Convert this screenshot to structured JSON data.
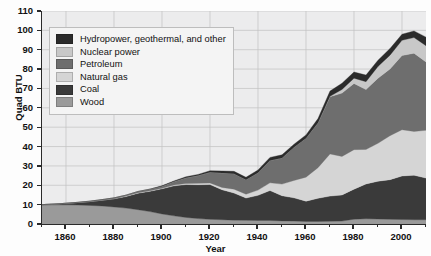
{
  "chart_data": {
    "type": "area",
    "stacked": true,
    "title": "",
    "xlabel": "Year",
    "ylabel": "Quad BTU",
    "xlim": [
      1850,
      2010
    ],
    "ylim": [
      0,
      110
    ],
    "xticks": [
      1860,
      1880,
      1900,
      1920,
      1940,
      1960,
      1980,
      2000
    ],
    "yticks": [
      0,
      10,
      20,
      30,
      40,
      50,
      60,
      70,
      80,
      90,
      100,
      110
    ],
    "grid": true,
    "legend_position": "upper-left",
    "x": [
      1850,
      1855,
      1860,
      1865,
      1870,
      1875,
      1880,
      1885,
      1890,
      1895,
      1900,
      1905,
      1910,
      1915,
      1920,
      1925,
      1930,
      1935,
      1940,
      1945,
      1950,
      1955,
      1960,
      1965,
      1970,
      1975,
      1980,
      1985,
      1990,
      1995,
      2000,
      2005,
      2010
    ],
    "series": [
      {
        "name": "Wood",
        "color": "#9a9a9a",
        "values": [
          9.8,
          9.9,
          9.9,
          9.8,
          9.6,
          9.3,
          8.8,
          8.2,
          7.4,
          6.4,
          5.2,
          4.2,
          3.4,
          2.8,
          2.4,
          2.2,
          2.0,
          1.9,
          1.8,
          1.8,
          1.6,
          1.5,
          1.3,
          1.3,
          1.4,
          1.5,
          2.5,
          2.7,
          2.6,
          2.4,
          2.3,
          2.2,
          2.2
        ]
      },
      {
        "name": "Coal",
        "color": "#3a3a3a",
        "values": [
          0.2,
          0.4,
          0.8,
          1.3,
          2.0,
          3.0,
          4.2,
          6.0,
          8.5,
          10.5,
          13.0,
          15.5,
          17.0,
          17.5,
          18.0,
          15.5,
          14.0,
          11.5,
          13.0,
          15.5,
          13.0,
          12.0,
          10.5,
          12.0,
          13.0,
          13.5,
          15.5,
          18.0,
          19.5,
          20.5,
          22.5,
          23.0,
          21.5
        ]
      },
      {
        "name": "Natural gas",
        "color": "#d5d5d5",
        "values": [
          0,
          0,
          0,
          0,
          0,
          0,
          0.1,
          0.2,
          0.3,
          0.3,
          0.3,
          0.4,
          0.5,
          0.7,
          0.8,
          1.2,
          2.0,
          2.0,
          2.7,
          4.0,
          6.0,
          9.0,
          12.4,
          15.8,
          21.8,
          19.9,
          20.4,
          17.8,
          19.6,
          22.7,
          23.9,
          22.6,
          24.7
        ]
      },
      {
        "name": "Petroleum",
        "color": "#6e6e6e",
        "values": [
          0,
          0,
          0,
          0.1,
          0.2,
          0.3,
          0.4,
          0.5,
          0.6,
          0.8,
          1.0,
          1.8,
          3.0,
          4.0,
          5.5,
          7.5,
          8.0,
          7.5,
          9.0,
          11.5,
          13.5,
          17.2,
          20.1,
          23.2,
          29.5,
          32.7,
          34.2,
          30.9,
          33.6,
          34.5,
          38.3,
          40.4,
          35.3
        ]
      },
      {
        "name": "Nuclear power",
        "color": "#c8c8c8",
        "values": [
          0,
          0,
          0,
          0,
          0,
          0,
          0,
          0,
          0,
          0,
          0,
          0,
          0,
          0,
          0,
          0,
          0,
          0,
          0,
          0,
          0,
          0,
          0.01,
          0.04,
          0.24,
          1.9,
          2.7,
          4.1,
          6.1,
          7.1,
          7.9,
          8.1,
          8.4
        ]
      },
      {
        "name": "Hydropower, geothermal, and other",
        "color": "#2b2b2b",
        "values": [
          0,
          0,
          0,
          0,
          0,
          0,
          0,
          0,
          0,
          0,
          0.25,
          0.35,
          0.5,
          0.6,
          0.8,
          1.0,
          1.2,
          1.2,
          1.4,
          1.6,
          1.6,
          1.5,
          1.7,
          2.1,
          2.7,
          3.2,
          3.2,
          3.4,
          3.2,
          3.4,
          3.1,
          3.4,
          4.4
        ]
      }
    ]
  },
  "legend": {
    "items": [
      {
        "label": "Hydropower, geothermal, and other",
        "color": "#2b2b2b"
      },
      {
        "label": "Nuclear power",
        "color": "#c8c8c8"
      },
      {
        "label": "Petroleum",
        "color": "#6e6e6e"
      },
      {
        "label": "Natural gas",
        "color": "#d5d5d5"
      },
      {
        "label": "Coal",
        "color": "#3a3a3a"
      },
      {
        "label": "Wood",
        "color": "#9a9a9a"
      }
    ]
  },
  "axes": {
    "y_title": "Quad BTU",
    "x_title": "Year",
    "y_tick_labels": [
      "0",
      "10",
      "20",
      "30",
      "40",
      "50",
      "60",
      "70",
      "80",
      "90",
      "100",
      "110"
    ],
    "x_tick_labels": [
      "1860",
      "1880",
      "1900",
      "1920",
      "1940",
      "1960",
      "1980",
      "2000"
    ]
  },
  "style": {
    "plot_background": "#ececed",
    "grid_color": "#c2c2c2",
    "axis_color": "#2a2a2a"
  }
}
